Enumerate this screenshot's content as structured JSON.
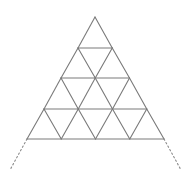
{
  "diagram": {
    "title": "",
    "rows": 4,
    "apex": [
      95,
      17
    ],
    "base_y": 139,
    "base_left_x": 27,
    "base_right_x": 164,
    "row_ys": [
      17,
      48,
      78,
      109,
      139
    ],
    "line_color": "#7a7a7a",
    "dotted_color": "#8a8a8a",
    "extensions": {
      "left": {
        "from": [
          27,
          139
        ],
        "to": [
          10,
          170
        ]
      },
      "right": {
        "from": [
          164,
          139
        ],
        "to": [
          181,
          170
        ]
      }
    }
  }
}
